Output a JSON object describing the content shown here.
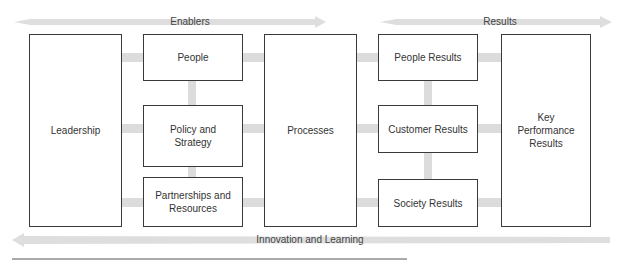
{
  "diagram": {
    "top_arrows": {
      "enablers": "Enablers",
      "results": "Results"
    },
    "bottom_arrow": "Innovation and Learning",
    "boxes": {
      "leadership": "Leadership",
      "people": "People",
      "policy_strategy": "Policy and Strategy",
      "partnerships_resources": "Partnerships and Resources",
      "processes": "Processes",
      "people_results": "People Results",
      "customer_results": "Customer Results",
      "society_results": "Society Results",
      "key_performance_results": "Key Performance Results"
    },
    "colors": {
      "arrow_fill": "#dedede",
      "connector": "#dadada",
      "box_border": "#3a3a3a"
    }
  }
}
